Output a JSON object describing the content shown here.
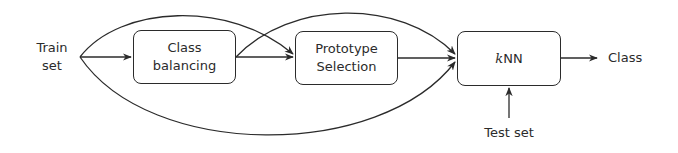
{
  "diagram": {
    "type": "flowchart",
    "inputs": {
      "train_set": {
        "line1": "Train",
        "line2": "set"
      },
      "test_set": "Test set"
    },
    "nodes": [
      {
        "id": "class_balancing",
        "line1": "Class",
        "line2": "balancing"
      },
      {
        "id": "prototype_selection",
        "line1": "Prototype",
        "line2": "Selection"
      },
      {
        "id": "knn",
        "k": "k",
        "rest": "NN"
      }
    ],
    "output": "Class",
    "edges": [
      {
        "from": "train_set",
        "to": "class_balancing",
        "style": "straight"
      },
      {
        "from": "train_set",
        "to": "prototype_selection",
        "style": "curved-over"
      },
      {
        "from": "train_set",
        "to": "knn",
        "style": "curved-under"
      },
      {
        "from": "class_balancing",
        "to": "prototype_selection",
        "style": "straight"
      },
      {
        "from": "class_balancing",
        "to": "knn",
        "style": "curved-over"
      },
      {
        "from": "prototype_selection",
        "to": "knn",
        "style": "straight"
      },
      {
        "from": "knn",
        "to": "class",
        "style": "straight"
      },
      {
        "from": "test_set",
        "to": "knn",
        "style": "straight-up"
      }
    ],
    "colors": {
      "stroke": "#2b2b2b",
      "background": "#ffffff"
    }
  }
}
